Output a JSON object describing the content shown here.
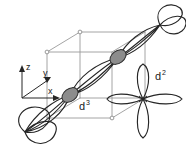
{
  "figure": {
    "title": "",
    "type": "orbital-overlap-diagram",
    "background": "#ffffff",
    "stroke_dark": "#222222",
    "stroke_cube": "#9a9a9a",
    "shade_fill": "#8c8c8c"
  },
  "axes": {
    "label_z": "z",
    "label_y": "y",
    "label_x": "x"
  },
  "orbitals": [
    {
      "id": "d3-chain",
      "label": "d",
      "superscript": "3",
      "label_full": "d3",
      "description": "diagonal chain of overlapping dumbbell orbitals",
      "lobe_count": 8,
      "shaded_node_count": 2
    },
    {
      "id": "d2-clover",
      "label": "d",
      "superscript": "2",
      "label_full": "d2",
      "description": "four-lobed clover orbital",
      "lobe_count": 4,
      "shaded_node_count": 0
    }
  ],
  "cube": {
    "description": "unit cell wireframe",
    "vertex_marker_count": 3
  }
}
